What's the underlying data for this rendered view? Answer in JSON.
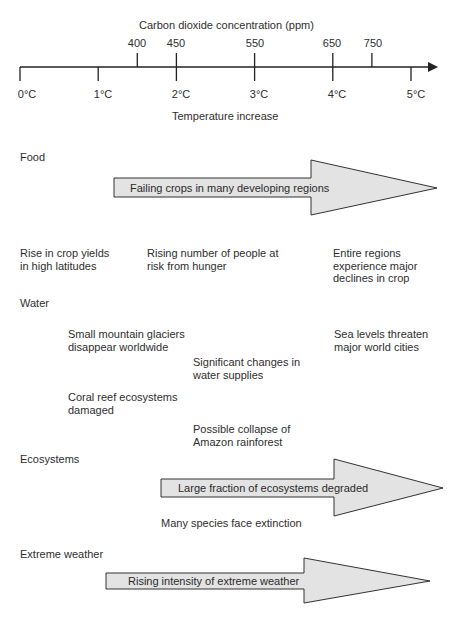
{
  "axis": {
    "co2_title": "Carbon dioxide concentration (ppm)",
    "temp_title": "Temperature increase",
    "co2_ticks": [
      {
        "label": "400",
        "temp": 1.5
      },
      {
        "label": "450",
        "temp": 2.0
      },
      {
        "label": "550",
        "temp": 3.0
      },
      {
        "label": "650",
        "temp": 4.0
      },
      {
        "label": "750",
        "temp": 4.5
      }
    ],
    "temp_ticks": [
      {
        "label": "0°C",
        "temp": 0
      },
      {
        "label": "1°C",
        "temp": 1
      },
      {
        "label": "2°C",
        "temp": 2
      },
      {
        "label": "3°C",
        "temp": 3
      },
      {
        "label": "4°C",
        "temp": 4
      },
      {
        "label": "5°C",
        "temp": 5
      }
    ],
    "line_color": "#222222"
  },
  "arrow_fill": "#e3e3e3",
  "arrow_stroke": "#333333",
  "sections": {
    "food": {
      "title": "Food",
      "arrow_label": "Failing crops in many developing regions",
      "impacts": [
        "Rise in crop yields\nin high latitudes",
        "Rising number of people at\nrisk from hunger",
        "Entire regions\nexperience major\ndeclines in crop"
      ]
    },
    "water": {
      "title": "Water",
      "impacts": [
        "Small mountain glaciers\ndisappear worldwide",
        "Significant changes in\nwater supplies",
        "Sea levels threaten\nmajor world cities",
        "Coral reef ecosystems\ndamaged",
        "Possible collapse of\nAmazon rainforest"
      ]
    },
    "ecosystems": {
      "title": "Ecosystems",
      "arrow_label": "Large fraction of ecosystems degraded",
      "impacts": [
        "Many species face extinction"
      ]
    },
    "weather": {
      "title": "Extreme weather",
      "arrow_label": "Rising intensity of extreme weather"
    }
  }
}
